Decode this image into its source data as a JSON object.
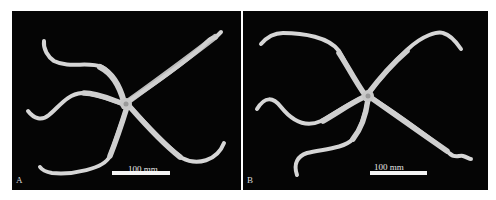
{
  "figure": {
    "panels": [
      {
        "id": "A",
        "label": "A",
        "scale_bar_label": "100 mm",
        "subject": "brittle star specimen, dorsal view",
        "background_color": "#050505",
        "specimen_color": "#d9d9d9"
      },
      {
        "id": "B",
        "label": "B",
        "scale_bar_label": "100 mm",
        "subject": "brittle star specimen, dorsal view",
        "background_color": "#050505",
        "specimen_color": "#d9d9d9"
      }
    ]
  }
}
